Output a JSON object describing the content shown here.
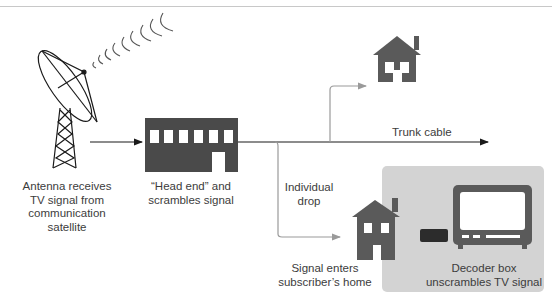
{
  "diagram": {
    "type": "cable-tv-signal-flow",
    "colors": {
      "ink": "#1a1a1a",
      "building": "#4a4a4a",
      "house": "#5a5a5a",
      "branch_line": "#9a9a9a",
      "panel": "#d3d3d3",
      "decoder": "#2c2c2c",
      "tv": "#5a5a5a"
    },
    "nodes": {
      "antenna": {
        "label_lines": [
          "Antenna receives",
          "TV signal from",
          "communication",
          "satellite"
        ]
      },
      "head_end": {
        "label_lines": [
          "“Head end” and",
          "scrambles signal"
        ]
      },
      "trunk": {
        "label": "Trunk cable"
      },
      "drop": {
        "label_lines": [
          "Individual",
          "drop"
        ]
      },
      "home": {
        "label_lines": [
          "Signal enters",
          "subscriber’s home"
        ]
      },
      "decoder": {
        "label_lines": [
          "Decoder box",
          "unscrambles TV signal"
        ]
      }
    },
    "edges": [
      {
        "from": "antenna",
        "to": "head_end"
      },
      {
        "from": "head_end",
        "to": "trunk"
      },
      {
        "from": "trunk",
        "to": "house-upper"
      },
      {
        "from": "trunk",
        "to": "home",
        "label": "Individual drop"
      }
    ]
  }
}
